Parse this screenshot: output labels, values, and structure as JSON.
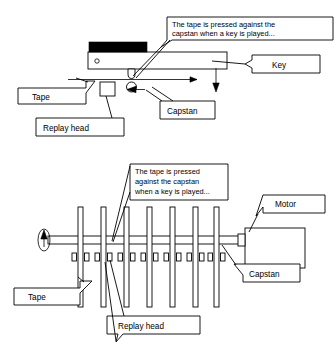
{
  "figure": {
    "background_color": "#ffffff",
    "line_color": "#000000",
    "key_fill_color": "#000000"
  },
  "top_diagram": {
    "name": "side-view-single-key",
    "callout": {
      "line1": "The tape is pressed against the",
      "line2": "capstan when a key is played..."
    },
    "labels": {
      "key": "Key",
      "tape": "Tape",
      "capstan": "Capstan",
      "replay_head": "Replay head"
    }
  },
  "bottom_diagram": {
    "name": "plan-view-multiple-keys",
    "callout": {
      "line1": "The tape is pressed",
      "line2": "against the capstan",
      "line3": "when a key is played..."
    },
    "labels": {
      "motor": "Motor",
      "capstan": "Capstan",
      "tape": "Tape",
      "replay_head": "Replay head"
    },
    "tape_strip_count": 7
  }
}
